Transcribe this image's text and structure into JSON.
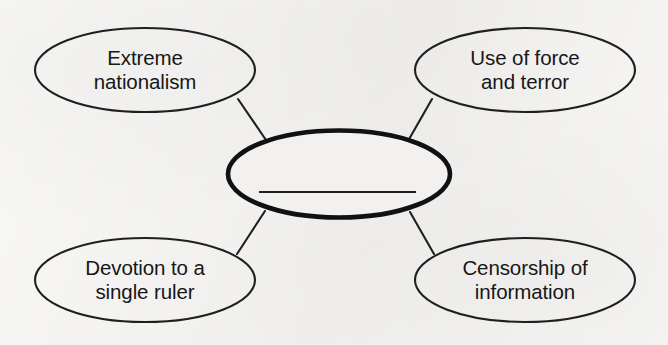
{
  "diagram": {
    "type": "concept-web",
    "background_color": "#f2f1ef",
    "ink_color": "#1a1a1a",
    "center": {
      "label": "",
      "is_blank": true,
      "answer_line": true,
      "border_weight": "thick"
    },
    "nodes": [
      {
        "id": "extreme-nationalism",
        "label": "Extreme\nnationalism",
        "position": "top-left",
        "border_weight": "thin"
      },
      {
        "id": "use-of-force-and-terror",
        "label": "Use of force\nand terror",
        "position": "top-right",
        "border_weight": "thin"
      },
      {
        "id": "devotion-to-a-single-ruler",
        "label": "Devotion to a\nsingle ruler",
        "position": "bottom-left",
        "border_weight": "thin"
      },
      {
        "id": "censorship-of-information",
        "label": "Censorship of\ninformation",
        "position": "bottom-right",
        "border_weight": "thin"
      }
    ],
    "connectors": [
      {
        "from": "extreme-nationalism",
        "to": "center"
      },
      {
        "from": "use-of-force-and-terror",
        "to": "center"
      },
      {
        "from": "devotion-to-a-single-ruler",
        "to": "center"
      },
      {
        "from": "censorship-of-information",
        "to": "center"
      }
    ]
  }
}
